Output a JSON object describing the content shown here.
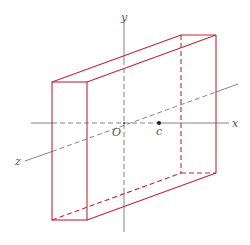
{
  "figure": {
    "axes": {
      "x_label": "x",
      "y_label": "y",
      "z_label": "z",
      "origin_label": "O",
      "point_label": "c"
    },
    "colors": {
      "box": "#c0283a",
      "axis": "#555555",
      "point": "#222222"
    }
  }
}
